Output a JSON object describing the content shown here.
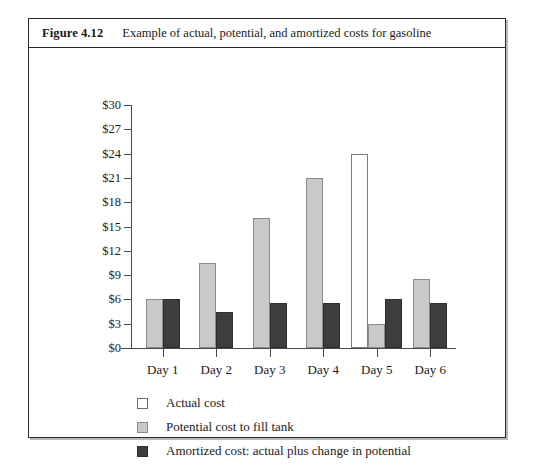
{
  "figure": {
    "number": "Figure 4.12",
    "caption": "Example of actual, potential, and amortized costs for gasoline"
  },
  "chart_data": {
    "type": "bar",
    "title": "Example of actual, potential, and amortized costs for gasoline",
    "xlabel": "",
    "ylabel": "",
    "ylim": [
      0,
      30
    ],
    "ytick_labels": [
      "$30",
      "$27",
      "$24",
      "$21",
      "$18",
      "$15",
      "$12",
      "$9",
      "$6",
      "$3",
      "$0"
    ],
    "ytick_values": [
      30,
      27,
      24,
      21,
      18,
      15,
      12,
      9,
      6,
      3,
      0
    ],
    "grid": false,
    "legend_position": "bottom-left",
    "categories": [
      "Day 1",
      "Day 2",
      "Day 3",
      "Day 4",
      "Day 5",
      "Day 6"
    ],
    "series": [
      {
        "name": "Actual cost",
        "color": "#ffffff",
        "values": [
          0,
          0,
          0,
          0,
          24,
          0
        ]
      },
      {
        "name": "Potential cost to fill tank",
        "color": "#c9c9c9",
        "values": [
          6,
          10.5,
          16,
          21,
          3,
          8.5
        ]
      },
      {
        "name": "Amortized cost: actual plus change in potential",
        "color": "#3d3d3d",
        "values": [
          6,
          4.5,
          5.5,
          5.5,
          6,
          5.5
        ]
      }
    ]
  },
  "legend": {
    "items": [
      {
        "label": "Actual cost",
        "swatch": "legend-swatch-actual"
      },
      {
        "label": "Potential cost to fill tank",
        "swatch": "legend-swatch-potential"
      },
      {
        "label": "Amortized cost: actual plus change in potential",
        "swatch": "legend-swatch-amortized"
      }
    ]
  }
}
